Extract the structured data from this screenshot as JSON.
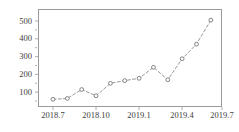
{
  "chart_data": {
    "type": "line",
    "title": "",
    "subtitle": "",
    "xlabel": "",
    "ylabel": "",
    "x": [
      "2018.7",
      "2018.8",
      "2018.9",
      "2018.10",
      "2018.11",
      "2018.12",
      "2019.1",
      "2019.2",
      "2019.3",
      "2019.4",
      "2019.5",
      "2019.6"
    ],
    "values": [
      60,
      65,
      115,
      80,
      150,
      165,
      178,
      240,
      170,
      288,
      370,
      505
    ],
    "series": [
      {
        "name": "series-1",
        "values": [
          60,
          65,
          115,
          80,
          150,
          165,
          178,
          240,
          170,
          288,
          370,
          505
        ]
      }
    ],
    "xtick_labels": [
      "2018.7",
      "2018.10",
      "2019.1",
      "2019.4",
      "2019.7"
    ],
    "xtick_values": [
      2018.7,
      2018.1,
      2019.1,
      2019.4,
      2019.7
    ],
    "ytick_labels": [
      "100",
      "200",
      "300",
      "400",
      "500"
    ],
    "ytick_values": [
      100,
      200,
      300,
      400,
      500
    ],
    "ylim": [
      0,
      540
    ],
    "xlim": [
      0,
      12.6
    ],
    "grid": false,
    "legend": null,
    "legend_position": "none",
    "marker": "circle-open",
    "line_style": "dashed",
    "line_color": "#8c8c8c",
    "marker_edge_color": "#6e6e6e",
    "marker_face_color": "#ffffff",
    "frame_color": "#9a9a9a",
    "background_color": "#ffffff",
    "annotations": []
  },
  "figure": {
    "axes_name": "line-plot-axes"
  }
}
